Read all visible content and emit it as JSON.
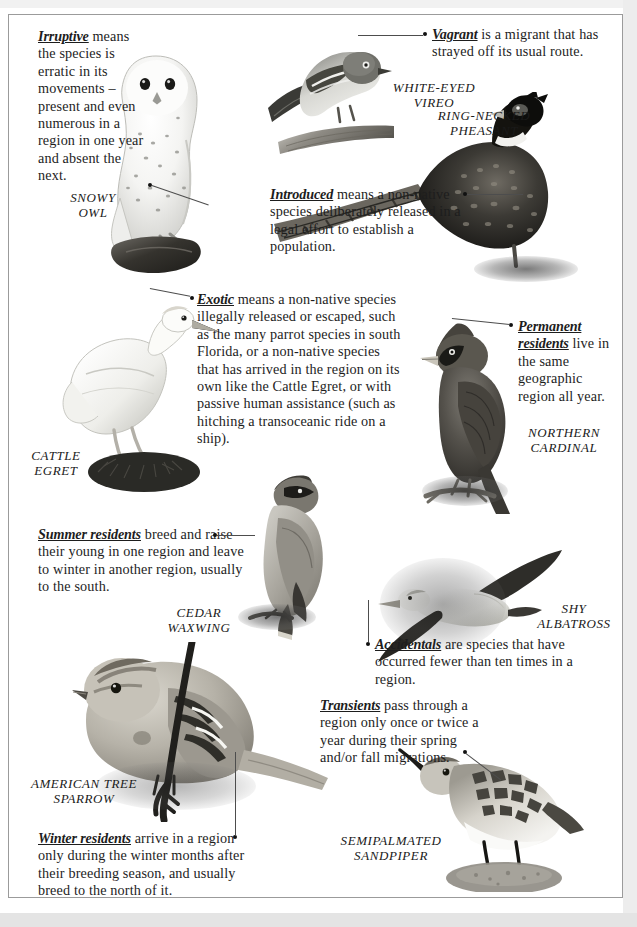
{
  "page": {
    "background_color": "#ffffff",
    "frame_color": "#9b9b9b"
  },
  "glossary": [
    {
      "id": "irruptive",
      "term": "Irruptive",
      "text": " means the species is erratic in its movements – present and even numerous in a region in one year and absent the next."
    },
    {
      "id": "vagrant",
      "term": "Vagrant",
      "text": " is a migrant that has strayed off its usual route."
    },
    {
      "id": "introduced",
      "term": "Introduced",
      "text": " means a non-native species deliberately released in a legal effort to establish a population."
    },
    {
      "id": "exotic",
      "term": "Exotic",
      "text": " means a non-native species illegally released or escaped, such as the many parrot species in south Florida, or a non-native species that has arrived in the region on its own like the Cattle Egret, or with passive human assistance (such as hitching a transoceanic ride on a ship)."
    },
    {
      "id": "permanent-residents",
      "term": "Permanent residents",
      "text": " live in the same geographic region all year."
    },
    {
      "id": "summer-residents",
      "term": "Summer residents",
      "text": " breed and raise their young in one region and leave to winter in another region, usually to the south."
    },
    {
      "id": "accidentals",
      "term": "Accidentals",
      "text": " are species that have occurred fewer than ten times in a region."
    },
    {
      "id": "transients",
      "term": "Transients",
      "text": " pass through a region only once or twice a year during their spring and/or fall migrations."
    },
    {
      "id": "winter-residents",
      "term": "Winter residents",
      "text": " arrive in a region only during the winter months after their breeding season, and usually breed to the north of it."
    }
  ],
  "species": [
    {
      "id": "snowy-owl",
      "line1": "SNOWY",
      "line2": "OWL"
    },
    {
      "id": "white-eyed-vireo",
      "line1": "WHITE-EYED",
      "line2": "VIREO"
    },
    {
      "id": "ring-necked-pheasant",
      "line1": "RING-NECKED",
      "line2": "PHEASANT"
    },
    {
      "id": "cattle-egret",
      "line1": "CATTLE",
      "line2": "EGRET"
    },
    {
      "id": "northern-cardinal",
      "line1": "NORTHERN",
      "line2": "CARDINAL"
    },
    {
      "id": "cedar-waxwing",
      "line1": "CEDAR",
      "line2": "WAXWING"
    },
    {
      "id": "shy-albatross",
      "line1": "SHY",
      "line2": "ALBATROSS"
    },
    {
      "id": "american-tree-sparrow",
      "line1": "AMERICAN TREE",
      "line2": "SPARROW"
    },
    {
      "id": "semipalmated-sandpiper",
      "line1": "SEMIPALMATED",
      "line2": "SANDPIPER"
    }
  ]
}
